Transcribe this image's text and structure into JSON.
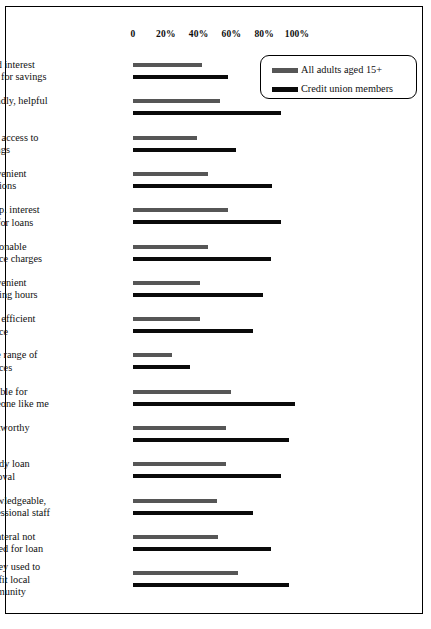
{
  "chart_data": {
    "type": "bar",
    "orientation": "horizontal",
    "title": "",
    "subtitle": "",
    "xlabel": "",
    "ylabel": "",
    "xlim": [
      0,
      110
    ],
    "xticks": [
      0,
      20,
      40,
      60,
      80,
      100
    ],
    "xtick_labels": [
      "0",
      "20%",
      "40%",
      "60%",
      "80%",
      "100%"
    ],
    "grid": false,
    "legend_position": "top-right",
    "categories": [
      "Good interest\nrates for savings",
      "Friendly, helpful\nstaff",
      "Easy access to\nsavings",
      "Convenient\nlocations",
      "Comp. interest\nrate for loans",
      "Reasonable\nservice charges",
      "Convenient\nopening hours",
      "Fast, efficient\nservice",
      "Wide range of\nservices",
      "Suitable for\nsomeone like me",
      "Trustworthy",
      "Speedy loan\napproval",
      "Knowledgeable,\nprofessional staff",
      "Collateral not\nneeded for loan",
      "Money used to\nbenefit local\ncommunity"
    ],
    "series": [
      {
        "name": "All adults aged 15+",
        "color": "#565656",
        "values": [
          42,
          53,
          39,
          46,
          58,
          46,
          41,
          41,
          24,
          60,
          57,
          57,
          51,
          52,
          64
        ]
      },
      {
        "name": "Credit union members",
        "color": "#0a0a0a",
        "values": [
          58,
          90,
          63,
          85,
          90,
          84,
          79,
          73,
          35,
          99,
          95,
          90,
          73,
          84,
          95
        ]
      }
    ]
  },
  "legend": {
    "items": [
      {
        "label": "All adults aged 15+",
        "color": "#565656"
      },
      {
        "label": "Credit union members",
        "color": "#0a0a0a"
      }
    ]
  }
}
